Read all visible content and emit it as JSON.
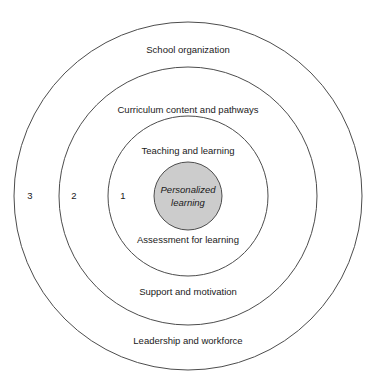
{
  "diagram": {
    "type": "concentric-circles",
    "background_color": "#ffffff",
    "stroke_color": "#4d4d4d",
    "text_color": "#1a1a1a",
    "center": {
      "x": 188,
      "y": 196
    },
    "core": {
      "label_line1": "Personalized",
      "label_line2": "learning",
      "radius": 34,
      "fill_color": "#cccccc",
      "italic": true
    },
    "rings": [
      {
        "number": "1",
        "radius": 80,
        "number_x": 123,
        "top_label": "Teaching and learning",
        "top_label_y": 151,
        "bottom_label": "Assessment for learning",
        "bottom_label_y": 240
      },
      {
        "number": "2",
        "radius": 129,
        "number_x": 74,
        "top_label": "Curriculum content and pathways",
        "top_label_y": 110,
        "bottom_label": "Support and motivation",
        "bottom_label_y": 292
      },
      {
        "number": "3",
        "radius": 174,
        "number_x": 30,
        "top_label": "School organization",
        "top_label_y": 50,
        "bottom_label": "Leadership and workforce",
        "bottom_label_y": 341
      }
    ]
  }
}
